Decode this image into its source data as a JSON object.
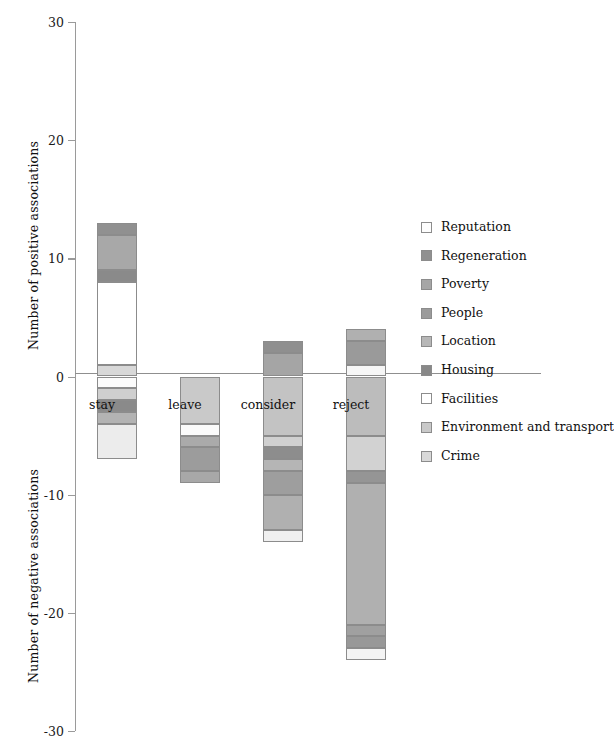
{
  "chart_data": {
    "type": "bar",
    "subtype": "stacked-diverging",
    "title": "",
    "xlabel": "",
    "ylabel_positive": "Number of positive associations",
    "ylabel_negative": "Number of negative associations",
    "ylim": [
      -30,
      30
    ],
    "yticks": [
      30,
      20,
      10,
      0,
      -10,
      -20,
      -30
    ],
    "ytick_labels": [
      "30",
      "20",
      "10",
      "0",
      "-10",
      "-20",
      "-30"
    ],
    "grid": false,
    "legend_position": "right",
    "categories": [
      "stay",
      "leave",
      "consider",
      "reject"
    ],
    "series": [
      {
        "name": "Reputation",
        "color": "#fbfbfb",
        "values": [
          0,
          0,
          0,
          0
        ],
        "negative_values": [
          -1,
          0,
          -1,
          -1
        ]
      },
      {
        "name": "Regeneration",
        "color": "#8f8f8f",
        "values": [
          1,
          0,
          1,
          1
        ],
        "negative_values": [
          0,
          0,
          0,
          0
        ]
      },
      {
        "name": "Poverty",
        "color": "#a3a3a3",
        "values": [
          0,
          0,
          0,
          0
        ],
        "negative_values": [
          0,
          0,
          0,
          -1
        ]
      },
      {
        "name": "People",
        "color": "#9e9e9e",
        "values": [
          3,
          0,
          0,
          0
        ],
        "negative_values": [
          -1,
          -3,
          -2,
          -10
        ]
      },
      {
        "name": "Location",
        "color": "#b5b5b5",
        "values": [
          0,
          0,
          0,
          0
        ],
        "negative_values": [
          0,
          0,
          -2,
          0
        ]
      },
      {
        "name": "Housing",
        "color": "#8a8a8a",
        "values": [
          1,
          0,
          0,
          2
        ],
        "negative_values": [
          -1,
          -1,
          -1,
          -2
        ]
      },
      {
        "name": "Facilities",
        "color": "#ffffff",
        "values": [
          7,
          0,
          0,
          0
        ],
        "negative_values": [
          0,
          -1,
          -1,
          0
        ]
      },
      {
        "name": "Environment and transport",
        "color": "#c9c9c9",
        "values": [
          0,
          0,
          2,
          0
        ],
        "negative_values": [
          0,
          -4,
          -6,
          -9
        ]
      },
      {
        "name": "Crime",
        "color": "#d8d8d8",
        "values": [
          1,
          0,
          0,
          1
        ],
        "negative_values": [
          -4,
          0,
          -1,
          -1
        ]
      }
    ],
    "positive_totals": [
      13,
      0,
      3,
      4
    ],
    "negative_totals": [
      -7,
      -9,
      -14,
      -24
    ],
    "stacks": {
      "stay": {
        "positive": [
          {
            "series": "Crime",
            "from": 0,
            "to": 1,
            "color": "#d8d8d8"
          },
          {
            "series": "Facilities",
            "from": 1,
            "to": 8,
            "color": "#ffffff"
          },
          {
            "series": "Housing",
            "from": 8,
            "to": 9,
            "color": "#8a8a8a"
          },
          {
            "series": "People",
            "from": 9,
            "to": 12,
            "color": "#a8a8a8"
          },
          {
            "series": "Regeneration",
            "from": 12,
            "to": 13,
            "color": "#909090"
          }
        ],
        "negative": [
          {
            "series": "Reputation",
            "from": 0,
            "to": -1,
            "color": "#fbfbfb"
          },
          {
            "series": "People",
            "from": -1,
            "to": -2,
            "color": "#cfcfcf"
          },
          {
            "series": "Housing",
            "from": -2,
            "to": -3,
            "color": "#8a8a8a"
          },
          {
            "series": "Environment and transport",
            "from": -3,
            "to": -4,
            "color": "#b3b3b3"
          },
          {
            "series": "Crime",
            "from": -4,
            "to": -7,
            "color": "#ececec"
          }
        ]
      },
      "leave": {
        "positive": [],
        "negative": [
          {
            "series": "Environment and transport",
            "from": 0,
            "to": -4,
            "color": "#c9c9c9"
          },
          {
            "series": "Facilities",
            "from": -4,
            "to": -5,
            "color": "#fafafa"
          },
          {
            "series": "Housing",
            "from": -5,
            "to": -6,
            "color": "#aaaaaa"
          },
          {
            "series": "People",
            "from": -6,
            "to": -8,
            "color": "#9c9c9c"
          },
          {
            "series": "Crime",
            "from": -8,
            "to": -9,
            "color": "#a8a8a8"
          }
        ]
      },
      "consider": {
        "positive": [
          {
            "series": "Environment and transport",
            "from": 0,
            "to": 2,
            "color": "#a5a5a5"
          },
          {
            "series": "Regeneration",
            "from": 2,
            "to": 3,
            "color": "#8f8f8f"
          }
        ],
        "negative": [
          {
            "series": "Environment and transport",
            "from": 0,
            "to": -5,
            "color": "#c3c3c3"
          },
          {
            "series": "Location",
            "from": -5,
            "to": -6,
            "color": "#d0d0d0"
          },
          {
            "series": "Housing",
            "from": -6,
            "to": -7,
            "color": "#8d8d8d"
          },
          {
            "series": "Crime",
            "from": -7,
            "to": -8,
            "color": "#b5b5b5"
          },
          {
            "series": "People",
            "from": -8,
            "to": -10,
            "color": "#9e9e9e"
          },
          {
            "series": "Poverty",
            "from": -10,
            "to": -13,
            "color": "#b0b0b0"
          },
          {
            "series": "Reputation",
            "from": -13,
            "to": -14,
            "color": "#f0f0f0"
          }
        ]
      },
      "reject": {
        "positive": [
          {
            "series": "Crime",
            "from": 0,
            "to": 1,
            "color": "#f6f6f6"
          },
          {
            "series": "Housing",
            "from": 1,
            "to": 3,
            "color": "#9a9a9a"
          },
          {
            "series": "Regeneration",
            "from": 3,
            "to": 4,
            "color": "#b0b0b0"
          }
        ],
        "negative": [
          {
            "series": "Environment and transport",
            "from": 0,
            "to": -5,
            "color": "#bcbcbc"
          },
          {
            "series": "Location",
            "from": -5,
            "to": -8,
            "color": "#d2d2d2"
          },
          {
            "series": "Housing",
            "from": -8,
            "to": -9,
            "color": "#959595"
          },
          {
            "series": "People",
            "from": -9,
            "to": -21,
            "color": "#b0b0b0"
          },
          {
            "series": "Poverty",
            "from": -21,
            "to": -22,
            "color": "#a0a0a0"
          },
          {
            "series": "Regeneration",
            "from": -22,
            "to": -23,
            "color": "#989898"
          },
          {
            "series": "Reputation",
            "from": -23,
            "to": -24,
            "color": "#f4f4f4"
          }
        ]
      }
    }
  },
  "legend": {
    "items": [
      {
        "label": "Reputation",
        "color": "#fdfdfd"
      },
      {
        "label": "Regeneration",
        "color": "#909090"
      },
      {
        "label": "Poverty",
        "color": "#a6a6a6"
      },
      {
        "label": "People",
        "color": "#9b9b9b"
      },
      {
        "label": "Location",
        "color": "#b7b7b7"
      },
      {
        "label": "Housing",
        "color": "#888888"
      },
      {
        "label": "Facilities",
        "color": "#ffffff"
      },
      {
        "label": "Environment and transport",
        "color": "#c9c9c9"
      },
      {
        "label": "Crime",
        "color": "#d9d9d9"
      }
    ]
  }
}
